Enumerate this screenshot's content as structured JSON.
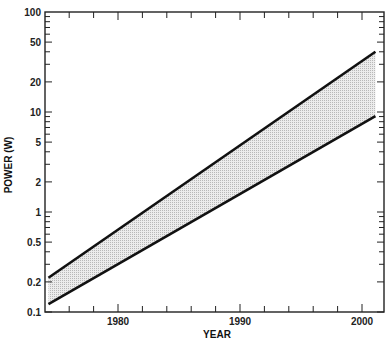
{
  "chart_data": {
    "type": "area",
    "title": "",
    "xlabel": "YEAR",
    "ylabel": "POWER (W)",
    "yscale": "log",
    "xlim": [
      1974,
      2002
    ],
    "ylim": [
      0.1,
      100
    ],
    "x_ticks": [
      1980,
      1990,
      2000
    ],
    "x_minor_step": 2,
    "y_tick_labels": [
      "100",
      "50",
      "20",
      "10",
      "5",
      "2",
      "1",
      "0.5",
      "0.2",
      "0.1"
    ],
    "y_tick_values": [
      100,
      50,
      20,
      10,
      5,
      2,
      1,
      0.5,
      0.2,
      0.1
    ],
    "grid": false,
    "legend": null,
    "series": [
      {
        "name": "upper bound",
        "x": [
          1974.3,
          2001.1
        ],
        "y": [
          0.22,
          40
        ]
      },
      {
        "name": "lower bound",
        "x": [
          1974.3,
          2001.1
        ],
        "y": [
          0.12,
          9.1
        ]
      }
    ],
    "band_fill": "shaded region between upper and lower bounds",
    "colors": {
      "line": "#111111",
      "band": "#d6d6d6",
      "axis": "#222222"
    }
  }
}
